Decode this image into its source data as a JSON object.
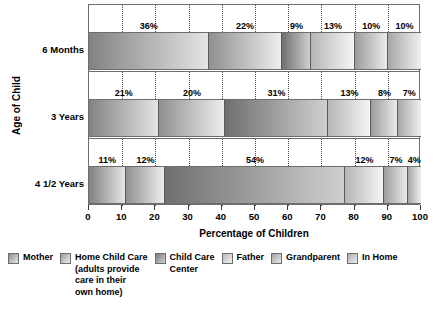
{
  "chart_data": {
    "type": "bar",
    "orientation": "horizontal",
    "stacked": true,
    "title": "",
    "xlabel": "Percentage of Children",
    "ylabel": "Age of Child",
    "xlim": [
      0,
      100
    ],
    "xticks": [
      "0",
      "10",
      "20",
      "30",
      "40",
      "50",
      "60",
      "70",
      "80",
      "90",
      "100"
    ],
    "grid": "dotted vertical gridlines every 10 units",
    "legend_position": "bottom",
    "categories": [
      "6 Months",
      "3 Years",
      "4 1/2 Years"
    ],
    "series": [
      {
        "name": "Mother",
        "values": [
          36,
          21,
          11
        ]
      },
      {
        "name": "Home Child Care (adults provide care in their own home)",
        "values": [
          22,
          20,
          12
        ]
      },
      {
        "name": "Child Care Center",
        "values": [
          9,
          31,
          54
        ]
      },
      {
        "name": "Father",
        "values": [
          13,
          13,
          12
        ]
      },
      {
        "name": "Grandparent",
        "values": [
          10,
          8,
          7
        ]
      },
      {
        "name": "In Home",
        "values": [
          10,
          7,
          4
        ]
      }
    ],
    "data_labels": [
      [
        "36%",
        "22%",
        "9%",
        "13%",
        "10%",
        "10%"
      ],
      [
        "21%",
        "20%",
        "31%",
        "13%",
        "8%",
        "7%"
      ],
      [
        "11%",
        "12%",
        "54%",
        "12%",
        "7%",
        "4%"
      ]
    ]
  },
  "legend": {
    "items": [
      {
        "label": "Mother",
        "swatch_from": "#8f8f8f",
        "swatch_to": "#e9e9e9"
      },
      {
        "label": "Home Child Care\n(adults provide\ncare in their\nown home)",
        "swatch_from": "#9a9a9a",
        "swatch_to": "#efefef"
      },
      {
        "label": "Child Care\nCenter",
        "swatch_from": "#7a7a7a",
        "swatch_to": "#d2d2d2"
      },
      {
        "label": "Father",
        "swatch_from": "#b8b8b8",
        "swatch_to": "#f4f4f4"
      },
      {
        "label": "Grandparent",
        "swatch_from": "#a2a2a2",
        "swatch_to": "#ececec"
      },
      {
        "label": "In Home",
        "swatch_from": "#ababab",
        "swatch_to": "#f0f0f0"
      }
    ]
  },
  "colors": {
    "axis": "#3a3a3a",
    "frame": "#6d6d6d",
    "gridline": "#4a4a4a",
    "background": "#ffffff",
    "text": "#000000"
  }
}
